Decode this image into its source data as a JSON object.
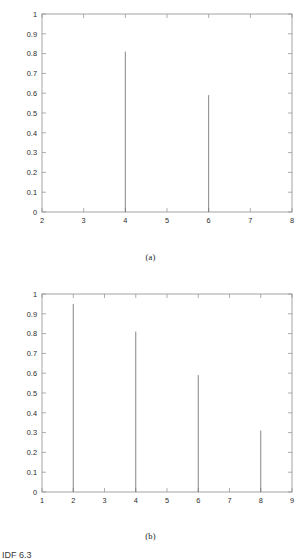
{
  "page": {
    "footer_partial_text": "IDF 6.3"
  },
  "figures": [
    {
      "caption": "(a)",
      "chart_index": 0
    },
    {
      "caption": "(b)",
      "chart_index": 1
    }
  ],
  "chart_data": [
    {
      "type": "bar",
      "title": "",
      "subtitle": "",
      "xlabel": "",
      "ylabel": "",
      "caption": "(a)",
      "style": "stem",
      "grid": false,
      "legend": false,
      "xlim": [
        2,
        8
      ],
      "ylim": [
        0,
        1
      ],
      "xticks": [
        2,
        3,
        4,
        5,
        6,
        7,
        8
      ],
      "xtick_labels": [
        "2",
        "3",
        "4",
        "5",
        "6",
        "7",
        "8"
      ],
      "yticks": [
        0,
        0.1,
        0.2,
        0.3,
        0.4,
        0.5,
        0.6,
        0.7,
        0.8,
        0.9,
        1
      ],
      "ytick_labels": [
        "0",
        "0.1",
        "0.2",
        "0.3",
        "0.4",
        "0.5",
        "0.6",
        "0.7",
        "0.8",
        "0.9",
        "1"
      ],
      "x": [
        4,
        6
      ],
      "values": [
        0.81,
        0.59
      ],
      "categories": [
        "4",
        "6"
      ],
      "line_color": "#6f6f6f",
      "axis_color": "#8d8d8d"
    },
    {
      "type": "bar",
      "title": "",
      "subtitle": "",
      "xlabel": "",
      "ylabel": "",
      "caption": "(b)",
      "style": "stem",
      "grid": false,
      "legend": false,
      "xlim": [
        1,
        9
      ],
      "ylim": [
        0,
        1
      ],
      "xticks": [
        1,
        2,
        3,
        4,
        5,
        6,
        7,
        8,
        9
      ],
      "xtick_labels": [
        "1",
        "2",
        "3",
        "4",
        "5",
        "6",
        "7",
        "8",
        "9"
      ],
      "yticks": [
        0,
        0.1,
        0.2,
        0.3,
        0.4,
        0.5,
        0.6,
        0.7,
        0.8,
        0.9,
        1
      ],
      "ytick_labels": [
        "0",
        "0.1",
        "0.2",
        "0.3",
        "0.4",
        "0.5",
        "0.6",
        "0.7",
        "0.8",
        "0.9",
        "1"
      ],
      "x": [
        2,
        4,
        6,
        8
      ],
      "values": [
        0.95,
        0.81,
        0.59,
        0.31
      ],
      "categories": [
        "2",
        "4",
        "6",
        "8"
      ],
      "line_color": "#6f6f6f",
      "axis_color": "#8d8d8d"
    }
  ]
}
